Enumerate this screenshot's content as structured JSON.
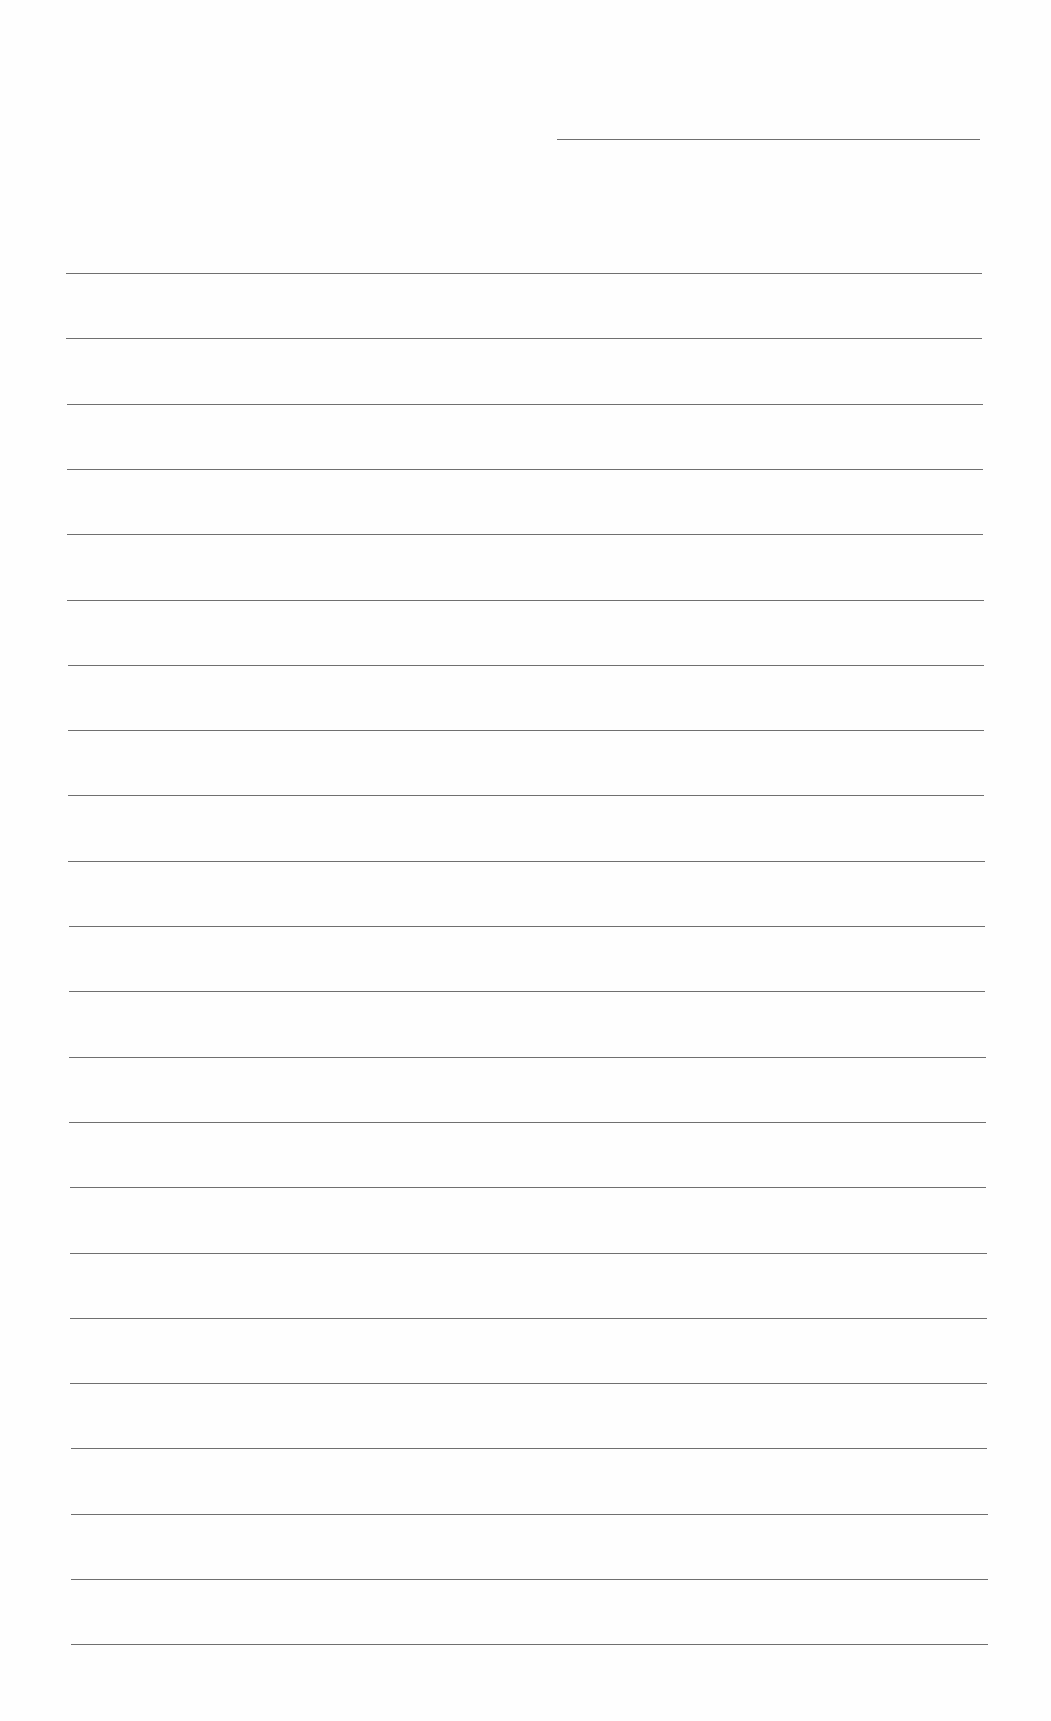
{
  "document": {
    "type": "lined-paper",
    "header": {
      "date_line": ""
    },
    "ruled_lines": {
      "count": 22,
      "first_y": 273,
      "spacing": 65.3,
      "left_x": 66,
      "right_x": 982,
      "color": "#6f6f6f"
    },
    "lines": [
      "",
      "",
      "",
      "",
      "",
      "",
      "",
      "",
      "",
      "",
      "",
      "",
      "",
      "",
      "",
      "",
      "",
      "",
      "",
      "",
      "",
      ""
    ]
  }
}
